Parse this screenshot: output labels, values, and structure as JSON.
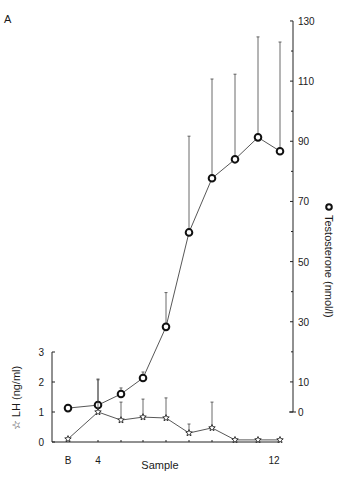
{
  "panel_label": "A",
  "chart_data": {
    "type": "line",
    "title": "",
    "panel": "A",
    "xlabel": "Sample",
    "x": [
      "B",
      "4",
      "5",
      "6",
      "7",
      "8",
      "9",
      "10",
      "11",
      "12"
    ],
    "x_tick_labels_shown": [
      "B",
      "4",
      "12"
    ],
    "series": [
      {
        "name": "Testosterone (nmol/l)",
        "marker": "open-circle",
        "axis": "right",
        "values": [
          1.3,
          2.3,
          6,
          11.3,
          28.3,
          59.7,
          77.7,
          84,
          91.3,
          86.7
        ],
        "error_upper": [
          null,
          10.7,
          8,
          13.3,
          39.7,
          91.7,
          110.7,
          112.3,
          124.7,
          123
        ]
      },
      {
        "name": "LH (ng/ml)",
        "marker": "open-star",
        "axis": "left",
        "values": [
          0.1,
          1.0,
          0.73,
          0.83,
          0.8,
          0.3,
          0.47,
          0.07,
          0.07,
          0.07
        ],
        "error_upper": [
          null,
          2.1,
          1.33,
          1.43,
          1.47,
          0.6,
          1.33,
          null,
          null,
          null
        ]
      }
    ],
    "left_axis": {
      "label": "LH (ng/ml)",
      "symbol": "☆",
      "ylim": [
        0,
        3
      ],
      "ticks": [
        0,
        1,
        2,
        3
      ]
    },
    "right_axis": {
      "label": "Testosterone (nmol/l)",
      "symbol": "o",
      "ylim": [
        0,
        130
      ],
      "ticks": [
        0,
        10,
        30,
        50,
        70,
        90,
        110,
        130
      ],
      "minor_ticks": [
        20,
        40,
        60,
        80,
        100,
        120
      ]
    },
    "grid": false,
    "legend": "axis labels"
  }
}
